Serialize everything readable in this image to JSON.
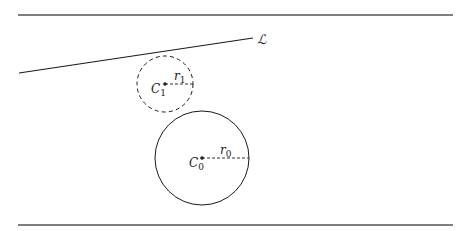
{
  "diagram": {
    "line": {
      "label": "ℒ",
      "x1": 19,
      "y1": 73,
      "x2": 253,
      "y2": 38
    },
    "rules": [
      {
        "name": "top-rule",
        "y": 15,
        "x1": 18,
        "x2": 453
      },
      {
        "name": "bottom-rule",
        "y": 225,
        "x1": 18,
        "x2": 453
      }
    ],
    "circles": [
      {
        "name": "C1",
        "center_label": "C",
        "center_sub": "1",
        "radius_label": "r",
        "radius_sub": "1",
        "cx": 165,
        "cy": 84,
        "r": 28,
        "style": "dashed"
      },
      {
        "name": "C0",
        "center_label": "C",
        "center_sub": "0",
        "radius_label": "r",
        "radius_sub": "0",
        "cx": 202,
        "cy": 158,
        "r": 47,
        "style": "solid"
      }
    ],
    "colors": {
      "stroke": "#1a1a1a",
      "rule": "#555555",
      "background": "#ffffff"
    }
  }
}
